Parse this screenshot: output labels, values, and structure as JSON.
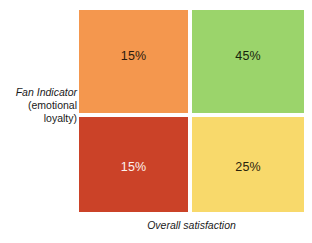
{
  "chart_data": {
    "type": "heatmap",
    "title": "",
    "xlabel": "Overall satisfaction",
    "ylabel": "Fan Indicator (emotional loyalty)",
    "grid": false,
    "legend": "none",
    "layout": "2x2 quadrant matrix",
    "categories_x": [
      "low",
      "high"
    ],
    "categories_y": [
      "high",
      "low"
    ],
    "cells": [
      {
        "id": "top-left",
        "row": "high",
        "column": "low",
        "value": 15,
        "label": "15%",
        "color": "#F4974E",
        "text_color": "#2b1a0c"
      },
      {
        "id": "top-right",
        "row": "high",
        "column": "high",
        "value": 45,
        "label": "45%",
        "color": "#9BD46B",
        "text_color": "#16240c"
      },
      {
        "id": "bottom-left",
        "row": "low",
        "column": "low",
        "value": 15,
        "label": "15%",
        "color": "#CB4228",
        "text_color": "#fdf2ee"
      },
      {
        "id": "bottom-right",
        "row": "low",
        "column": "high",
        "value": 25,
        "label": "25%",
        "color": "#F8D96B",
        "text_color": "#2b230c"
      }
    ],
    "values": [
      15,
      45,
      15,
      25
    ]
  },
  "axes": {
    "y_label_line1": "Fan Indicator",
    "y_label_line2": "(emotional",
    "y_label_line3": "loyalty)",
    "x_label": "Overall satisfaction"
  }
}
